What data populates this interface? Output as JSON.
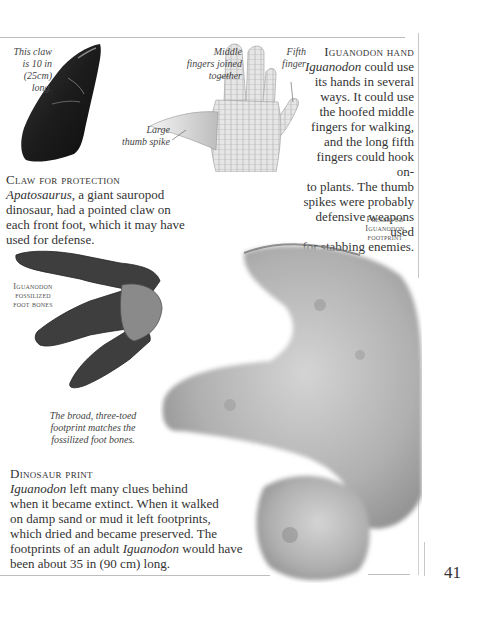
{
  "page_number": "41",
  "claw": {
    "caption": [
      "This claw",
      "is 10 in",
      "(25cm)",
      "long."
    ],
    "heading": "Claw for protection",
    "body_italic": "Apatosaurus",
    "body": ", a giant sauropod dinosaur, had a pointed claw on each front foot, which it may have used for defense."
  },
  "hand": {
    "middle_caption": [
      "Middle",
      "fingers joined",
      "together"
    ],
    "fifth_caption": [
      "Fifth",
      "finger"
    ],
    "thumb_caption": [
      "Large",
      "thumb spike"
    ],
    "heading": "Iguanodon hand",
    "body_italic": "Iguanodon",
    "lines": [
      " could use",
      "its hands in several",
      "ways. It could use",
      "the hoofed middle",
      "fingers for walking,",
      "and the long fifth",
      "fingers could hook on-",
      "to plants. The thumb",
      "spikes were probably",
      "defensive weapons used",
      "for stabbing enemies."
    ]
  },
  "footprint_label": [
    "Preserved",
    "Iguanodon",
    "footprint"
  ],
  "foot_bones_label": [
    "Iguanodon",
    "fossilized",
    "foot bones"
  ],
  "broad_caption": [
    "The broad, three-toed",
    "footprint matches the",
    "fossilized foot bones."
  ],
  "print": {
    "heading": "Dinosaur print",
    "line1_italic": "Iguanodon",
    "line1": " left many clues behind",
    "line2": "when it became extinct. When it walked",
    "line3": "on damp sand or mud it left footprints,",
    "line4": "which dried and became preserved. The",
    "line5_a": "footprints of an adult ",
    "line5_italic": "Iguanodon",
    "line5_b": " would have",
    "line6": "been about 35 in (90 cm) long."
  }
}
